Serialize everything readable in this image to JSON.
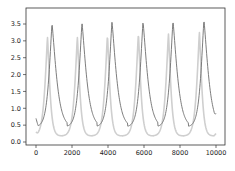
{
  "chart_data": {
    "type": "line",
    "title": "",
    "xlabel": "",
    "ylabel": "",
    "xlim": [
      -550,
      10550
    ],
    "ylim": [
      -0.05,
      3.75
    ],
    "grid": false,
    "legend": null,
    "x_ticks": [
      0,
      2000,
      4000,
      6000,
      8000,
      10000
    ],
    "x_tick_labels": [
      "0",
      "2000",
      "4000",
      "6000",
      "8000",
      "10000"
    ],
    "y_ticks": [
      0.0,
      0.5,
      1.0,
      1.5,
      2.0,
      2.5,
      3.0,
      3.5
    ],
    "y_tick_labels": [
      "0.0",
      "0.5",
      "1.0",
      "1.5",
      "2.0",
      "2.5",
      "3.0",
      "3.5"
    ],
    "series": [
      {
        "name": "series-dark",
        "color": "#6e6e6e",
        "peak_times": [
          890,
          2555,
          4220,
          5945,
          7610,
          9330
        ],
        "peak_values": [
          3.5,
          3.52,
          3.55,
          3.55,
          3.57,
          3.6
        ],
        "min_value": 0.45,
        "start_value": 0.7,
        "end_value": 0.85
      },
      {
        "name": "series-light",
        "color": "#cfcfcf",
        "peak_times": [
          640,
          2300,
          3970,
          5690,
          7360,
          9080
        ],
        "peak_values": [
          3.1,
          3.1,
          3.15,
          3.2,
          3.2,
          3.25
        ],
        "min_value": 0.18,
        "start_value": 0.3,
        "end_value": 0.25
      }
    ],
    "x_range": [
      0,
      10000
    ]
  }
}
